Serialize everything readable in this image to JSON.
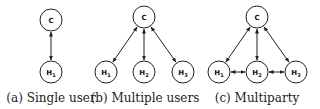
{
  "panels": [
    {
      "id": "a",
      "caption": "(a) Single user",
      "caption_x": 51,
      "nodes": [
        {
          "id": "C",
          "label": "C",
          "sub": "",
          "x": 51,
          "y": 20
        },
        {
          "id": "H1",
          "label": "H",
          "sub": "1",
          "x": 51,
          "y": 72
        }
      ],
      "edges": [
        [
          "C",
          "H1"
        ]
      ]
    },
    {
      "id": "b",
      "caption": "(b) Multiple users",
      "caption_x": 145,
      "nodes": [
        {
          "id": "C",
          "label": "C",
          "sub": "",
          "x": 144,
          "y": 17
        },
        {
          "id": "H1",
          "label": "H",
          "sub": "1",
          "x": 106,
          "y": 72
        },
        {
          "id": "H2",
          "label": "H",
          "sub": "2",
          "x": 144,
          "y": 72
        },
        {
          "id": "H3",
          "label": "H",
          "sub": "3",
          "x": 183,
          "y": 72
        }
      ],
      "edges": [
        [
          "C",
          "H1"
        ],
        [
          "C",
          "H2"
        ],
        [
          "C",
          "H3"
        ]
      ]
    },
    {
      "id": "c",
      "caption": "(c) Multiparty",
      "caption_x": 257,
      "nodes": [
        {
          "id": "C",
          "label": "C",
          "sub": "",
          "x": 257,
          "y": 17
        },
        {
          "id": "H1",
          "label": "H",
          "sub": "1",
          "x": 219,
          "y": 72
        },
        {
          "id": "H2",
          "label": "H",
          "sub": "2",
          "x": 257,
          "y": 72
        },
        {
          "id": "H3",
          "label": "H",
          "sub": "3",
          "x": 296,
          "y": 72
        }
      ],
      "edges": [
        [
          "C",
          "H1"
        ],
        [
          "C",
          "H2"
        ],
        [
          "C",
          "H3"
        ],
        [
          "H1",
          "H2"
        ],
        [
          "H2",
          "H3"
        ]
      ]
    }
  ],
  "style": {
    "node_radius": 11,
    "stroke_color": "#222222",
    "edge_type": "bidirectional-arrow"
  }
}
